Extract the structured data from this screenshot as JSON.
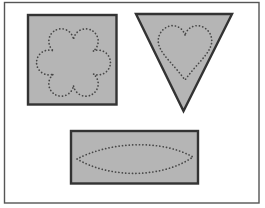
{
  "figure": {
    "panels": [
      {
        "name": "square-with-flower-outline",
        "outer_shape": "square",
        "dotted_shape": "flower"
      },
      {
        "name": "triangle-with-heart-outline",
        "outer_shape": "inverted-triangle",
        "dotted_shape": "heart"
      },
      {
        "name": "rectangle-with-leaf-outline",
        "outer_shape": "rectangle",
        "dotted_shape": "leaf"
      }
    ],
    "colors": {
      "background": "#ffffff",
      "panel_fill": "#b5b5b5",
      "panel_stroke": "#333333",
      "dotted_stroke": "#474747",
      "frame_stroke": "#555555"
    }
  }
}
